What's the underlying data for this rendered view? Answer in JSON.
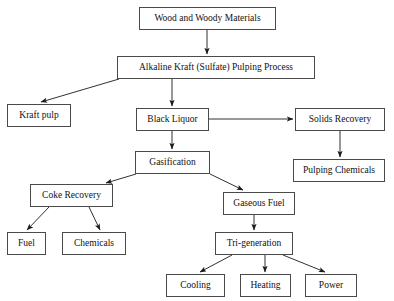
{
  "diagram": {
    "style": {
      "background_color": "#ffffff",
      "box_border_color": "#4a4a4a",
      "box_fill_color": "#ffffff",
      "text_color": "#111111",
      "arrow_color": "#1a1a1a"
    },
    "nodes": [
      {
        "id": "wood",
        "label": "Wood and Woody Materials",
        "x": 139,
        "y": 7,
        "w": 137,
        "h": 23,
        "font_size": 9.5
      },
      {
        "id": "kraft",
        "label": "Alkaline Kraft (Sulfate) Pulping Process",
        "x": 117,
        "y": 56,
        "w": 198,
        "h": 23,
        "font_size": 9.5
      },
      {
        "id": "kraftpulp",
        "label": "Kraft pulp",
        "x": 7,
        "y": 104,
        "w": 64,
        "h": 23,
        "font_size": 9.5
      },
      {
        "id": "blackliquor",
        "label": "Black Liquor",
        "x": 136,
        "y": 108,
        "w": 73,
        "h": 23,
        "font_size": 9.5
      },
      {
        "id": "solids",
        "label": "Solids Recovery",
        "x": 295,
        "y": 108,
        "w": 90,
        "h": 23,
        "font_size": 9.5
      },
      {
        "id": "gasification",
        "label": "Gasification",
        "x": 135,
        "y": 151,
        "w": 75,
        "h": 23,
        "font_size": 9.5
      },
      {
        "id": "pulpingchem",
        "label": "Pulping Chemicals",
        "x": 293,
        "y": 159,
        "w": 92,
        "h": 23,
        "font_size": 9.5
      },
      {
        "id": "coke",
        "label": "Coke Recovery",
        "x": 30,
        "y": 184,
        "w": 83,
        "h": 23,
        "font_size": 9.5
      },
      {
        "id": "gaseous",
        "label": "Gaseous Fuel",
        "x": 223,
        "y": 192,
        "w": 72,
        "h": 23,
        "font_size": 9.5
      },
      {
        "id": "fuel",
        "label": "Fuel",
        "x": 7,
        "y": 232,
        "w": 39,
        "h": 23,
        "font_size": 9.5
      },
      {
        "id": "chemicals",
        "label": "Chemicals",
        "x": 62,
        "y": 232,
        "w": 64,
        "h": 23,
        "font_size": 9.5
      },
      {
        "id": "trigen",
        "label": "Tri-generation",
        "x": 215,
        "y": 232,
        "w": 78,
        "h": 23,
        "font_size": 9.5
      },
      {
        "id": "cooling",
        "label": "Cooling",
        "x": 166,
        "y": 274,
        "w": 59,
        "h": 23,
        "font_size": 9.5
      },
      {
        "id": "heating",
        "label": "Heating",
        "x": 240,
        "y": 274,
        "w": 51,
        "h": 23,
        "font_size": 9.5
      },
      {
        "id": "power",
        "label": "Power",
        "x": 305,
        "y": 274,
        "w": 52,
        "h": 23,
        "font_size": 9.5
      }
    ],
    "edges": [
      {
        "id": "wood-to-kraft",
        "from": "wood",
        "to": "kraft",
        "points": [
          [
            207,
            30
          ],
          [
            207,
            54
          ]
        ]
      },
      {
        "id": "kraft-to-kraftpulp",
        "from": "kraft",
        "to": "kraftpulp",
        "points": [
          [
            119,
            79
          ],
          [
            41,
            102
          ]
        ]
      },
      {
        "id": "kraft-to-blackliquor",
        "from": "kraft",
        "to": "blackliquor",
        "points": [
          [
            172,
            79
          ],
          [
            172,
            106
          ]
        ]
      },
      {
        "id": "blackliquor-to-solids",
        "from": "blackliquor",
        "to": "solids",
        "points": [
          [
            209,
            119
          ],
          [
            293,
            119
          ]
        ]
      },
      {
        "id": "blackliquor-to-gasification",
        "from": "blackliquor",
        "to": "gasification",
        "points": [
          [
            172,
            131
          ],
          [
            172,
            149
          ]
        ]
      },
      {
        "id": "solids-to-pulpingchem",
        "from": "solids",
        "to": "pulpingchem",
        "points": [
          [
            340,
            131
          ],
          [
            340,
            157
          ]
        ]
      },
      {
        "id": "gasification-to-coke",
        "from": "gasification",
        "to": "coke",
        "points": [
          [
            136,
            174
          ],
          [
            106,
            183
          ]
        ]
      },
      {
        "id": "gasification-to-gaseous",
        "from": "gasification",
        "to": "gaseous",
        "points": [
          [
            210,
            174
          ],
          [
            243,
            190
          ]
        ]
      },
      {
        "id": "coke-to-fuel",
        "from": "coke",
        "to": "fuel",
        "points": [
          [
            49,
            207
          ],
          [
            27,
            230
          ]
        ]
      },
      {
        "id": "coke-to-chemicals",
        "from": "coke",
        "to": "chemicals",
        "points": [
          [
            89,
            207
          ],
          [
            100,
            230
          ]
        ]
      },
      {
        "id": "gaseous-to-trigen",
        "from": "gaseous",
        "to": "trigen",
        "points": [
          [
            254,
            215
          ],
          [
            254,
            230
          ]
        ]
      },
      {
        "id": "trigen-to-cooling",
        "from": "trigen",
        "to": "cooling",
        "points": [
          [
            232,
            255
          ],
          [
            200,
            272
          ]
        ]
      },
      {
        "id": "trigen-to-heating",
        "from": "trigen",
        "to": "heating",
        "points": [
          [
            265,
            255
          ],
          [
            265,
            272
          ]
        ]
      },
      {
        "id": "trigen-to-power",
        "from": "trigen",
        "to": "power",
        "points": [
          [
            283,
            255
          ],
          [
            325,
            272
          ]
        ]
      }
    ]
  }
}
